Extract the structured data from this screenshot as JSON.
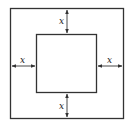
{
  "diagram": {
    "labels": {
      "top": "x",
      "left": "x",
      "right": "x",
      "bottom": "x"
    },
    "colors": {
      "stroke": "#333333",
      "background": "#ffffff"
    }
  }
}
